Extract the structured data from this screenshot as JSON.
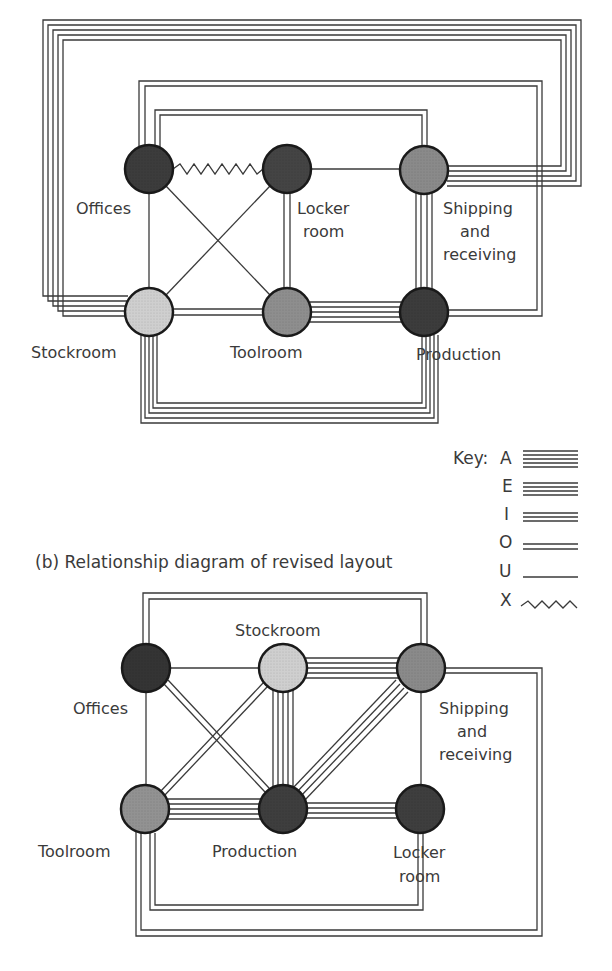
{
  "figure": {
    "top_caption_partial": "(a) Relationship diagram of original layout",
    "bottom_caption": "(b)  Relationship diagram of revised layout"
  },
  "colors": {
    "line": "#3a3a3a",
    "node_stroke": "#1a1a1a",
    "dark": "#3c3c3c",
    "medium": "#8a8a8a",
    "light": "#cfcfcf"
  },
  "key": {
    "title": "Key:",
    "items": [
      {
        "code": "A",
        "lines": 5,
        "meaning": "Absolutely necessary"
      },
      {
        "code": "E",
        "lines": 4,
        "meaning": "Especially important"
      },
      {
        "code": "I",
        "lines": 3,
        "meaning": "Important"
      },
      {
        "code": "O",
        "lines": 2,
        "meaning": "Ordinary closeness"
      },
      {
        "code": "U",
        "lines": 1,
        "meaning": "Unimportant"
      },
      {
        "code": "X",
        "lines": 0,
        "meaning": "Undesirable (zigzag)"
      }
    ]
  },
  "diagram_a": {
    "nodes": [
      {
        "id": "offices",
        "label": [
          "Offices"
        ],
        "shade": "dark"
      },
      {
        "id": "locker",
        "label": [
          "Locker",
          "room"
        ],
        "shade": "dark"
      },
      {
        "id": "shipping",
        "label": [
          "Shipping",
          "and",
          "receiving"
        ],
        "shade": "medium"
      },
      {
        "id": "stockroom",
        "label": [
          "Stockroom"
        ],
        "shade": "light"
      },
      {
        "id": "toolroom",
        "label": [
          "Toolroom"
        ],
        "shade": "medium"
      },
      {
        "id": "production",
        "label": [
          "Production"
        ],
        "shade": "dark"
      }
    ],
    "edges": [
      {
        "from": "offices",
        "to": "locker",
        "rating": "X"
      },
      {
        "from": "locker",
        "to": "shipping",
        "rating": "U"
      },
      {
        "from": "offices",
        "to": "stockroom",
        "rating": "U"
      },
      {
        "from": "offices",
        "to": "toolroom",
        "rating": "U"
      },
      {
        "from": "locker",
        "to": "stockroom",
        "rating": "U"
      },
      {
        "from": "locker",
        "to": "toolroom",
        "rating": "O"
      },
      {
        "from": "shipping",
        "to": "production",
        "rating": "E"
      },
      {
        "from": "stockroom",
        "to": "toolroom",
        "rating": "O"
      },
      {
        "from": "toolroom",
        "to": "production",
        "rating": "A"
      },
      {
        "from": "stockroom",
        "to": "production",
        "rating": "A"
      },
      {
        "from": "stockroom",
        "to": "shipping",
        "rating": "A"
      },
      {
        "from": "offices",
        "to": "production",
        "rating": "O"
      },
      {
        "from": "offices",
        "to": "shipping",
        "rating": "O"
      }
    ]
  },
  "diagram_b": {
    "nodes": [
      {
        "id": "offices",
        "label": [
          "Offices"
        ],
        "shade": "dark"
      },
      {
        "id": "stockroom",
        "label": [
          "Stockroom"
        ],
        "shade": "light"
      },
      {
        "id": "shipping",
        "label": [
          "Shipping",
          "and",
          "receiving"
        ],
        "shade": "medium"
      },
      {
        "id": "toolroom",
        "label": [
          "Toolroom"
        ],
        "shade": "medium"
      },
      {
        "id": "production",
        "label": [
          "Production"
        ],
        "shade": "dark"
      },
      {
        "id": "locker",
        "label": [
          "Locker",
          "room"
        ],
        "shade": "dark"
      }
    ],
    "edges": [
      {
        "from": "offices",
        "to": "stockroom",
        "rating": "U"
      },
      {
        "from": "stockroom",
        "to": "shipping",
        "rating": "A"
      },
      {
        "from": "offices",
        "to": "toolroom",
        "rating": "U"
      },
      {
        "from": "offices",
        "to": "production",
        "rating": "O"
      },
      {
        "from": "stockroom",
        "to": "toolroom",
        "rating": "O"
      },
      {
        "from": "stockroom",
        "to": "production",
        "rating": "A"
      },
      {
        "from": "shipping",
        "to": "production",
        "rating": "E"
      },
      {
        "from": "shipping",
        "to": "locker",
        "rating": "U"
      },
      {
        "from": "toolroom",
        "to": "production",
        "rating": "A"
      },
      {
        "from": "production",
        "to": "locker",
        "rating": "E"
      },
      {
        "from": "offices",
        "to": "shipping",
        "rating": "O"
      },
      {
        "from": "toolroom",
        "to": "locker",
        "rating": "O"
      },
      {
        "from": "toolroom",
        "to": "shipping",
        "rating": "O"
      }
    ]
  }
}
